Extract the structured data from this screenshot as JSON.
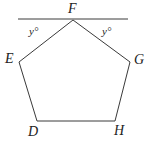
{
  "diagram": {
    "type": "geometry-figure",
    "shape": "pentagon",
    "colors": {
      "stroke": "#3a3a3a",
      "text": "#222222",
      "background": "#ffffff"
    },
    "line": {
      "x1": 18,
      "y1": 19,
      "x2": 128,
      "y2": 19
    },
    "vertices": [
      {
        "name": "F",
        "x": 73,
        "y": 20,
        "label_x": 68,
        "label_y": 13
      },
      {
        "name": "G",
        "x": 130,
        "y": 62,
        "label_x": 134,
        "label_y": 64
      },
      {
        "name": "H",
        "x": 115,
        "y": 121,
        "label_x": 114,
        "label_y": 135
      },
      {
        "name": "D",
        "x": 37,
        "y": 121,
        "label_x": 28,
        "label_y": 136
      },
      {
        "name": "E",
        "x": 19,
        "y": 62,
        "label_x": 5,
        "label_y": 63
      }
    ],
    "angle_labels": [
      {
        "text": "y°",
        "x": 29,
        "y": 35
      },
      {
        "text": "y°",
        "x": 102,
        "y": 35
      }
    ]
  }
}
